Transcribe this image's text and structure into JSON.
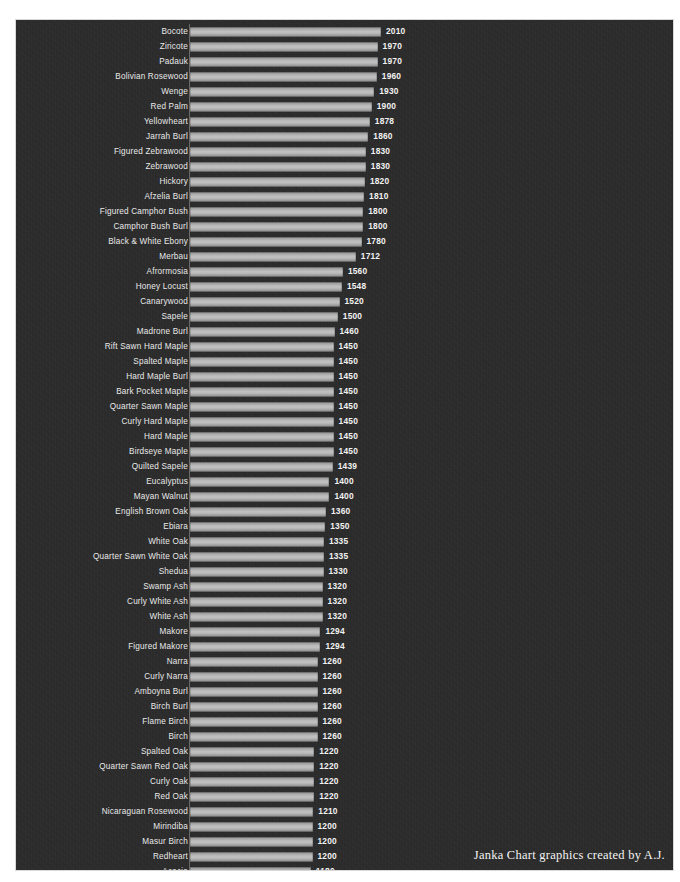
{
  "credit": "Janka Chart graphics created by A.J.",
  "chart_data": {
    "type": "bar",
    "orientation": "horizontal",
    "title": "",
    "subtitle": "",
    "xlabel": "",
    "ylabel": "",
    "grid": false,
    "legend": false,
    "xlim": [
      0,
      2010
    ],
    "value_unit": "lbf",
    "sorted": "descending",
    "colors": {
      "background": "#2b2b2b",
      "bar": "#bdbdbd",
      "label_text": "#e9e9e9",
      "value_text": "#f2f2f2",
      "axis": "#6a6a6a",
      "page": "#ffffff"
    },
    "categories": [
      "Bocote",
      "Ziricote",
      "Padauk",
      "Bolivian Rosewood",
      "Wenge",
      "Red Palm",
      "Yellowheart",
      "Jarrah Burl",
      "Figured Zebrawood",
      "Zebrawood",
      "Hickory",
      "Afzelia Burl",
      "Figured Camphor Bush",
      "Camphor Bush Burl",
      "Black & White Ebony",
      "Merbau",
      "Afrormosia",
      "Honey Locust",
      "Canarywood",
      "Sapele",
      "Madrone Burl",
      "Rift Sawn Hard Maple",
      "Spalted Maple",
      "Hard Maple Burl",
      "Bark Pocket Maple",
      "Quarter Sawn Maple",
      "Curly Hard Maple",
      "Hard Maple",
      "Birdseye Maple",
      "Quilted Sapele",
      "Eucalyptus",
      "Mayan Walnut",
      "English Brown Oak",
      "Ebiara",
      "White Oak",
      "Quarter Sawn White Oak",
      "Shedua",
      "Swamp Ash",
      "Curly White Ash",
      "White Ash",
      "Makore",
      "Figured Makore",
      "Narra",
      "Curly Narra",
      "Amboyna Burl",
      "Birch Burl",
      "Flame Birch",
      "Birch",
      "Spalted Oak",
      "Quarter Sawn Red Oak",
      "Curly Oak",
      "Red Oak",
      "Nicaraguan Rosewood",
      "Mirindiba",
      "Masur Birch",
      "Redheart",
      "Acacia",
      "Koa",
      "Thuya Burl"
    ],
    "values": [
      2010,
      1970,
      1970,
      1960,
      1930,
      1900,
      1878,
      1860,
      1830,
      1830,
      1820,
      1810,
      1800,
      1800,
      1780,
      1712,
      1560,
      1548,
      1520,
      1500,
      1460,
      1450,
      1450,
      1450,
      1450,
      1450,
      1450,
      1450,
      1450,
      1439,
      1400,
      1400,
      1360,
      1350,
      1335,
      1335,
      1330,
      1320,
      1320,
      1320,
      1294,
      1294,
      1260,
      1260,
      1260,
      1260,
      1260,
      1260,
      1220,
      1220,
      1220,
      1220,
      1210,
      1200,
      1200,
      1200,
      1180,
      1170,
      1160
    ]
  }
}
